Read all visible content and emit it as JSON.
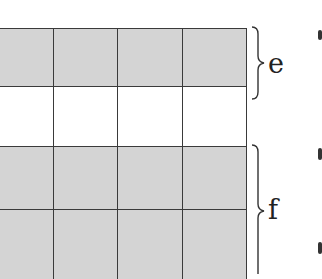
{
  "diagram": {
    "type": "grid-with-brackets",
    "columns_visible": 4,
    "rows": [
      {
        "index": 0,
        "fill": "shaded",
        "cells": 4
      },
      {
        "index": 1,
        "fill": "blank",
        "cells": 4
      },
      {
        "index": 2,
        "fill": "shaded",
        "cells": 4
      },
      {
        "index": 3,
        "fill": "shaded",
        "cells": 4
      }
    ],
    "colors": {
      "shaded": "#d4d4d4",
      "blank": "#ffffff",
      "line": "#3a3a3a"
    },
    "brackets": [
      {
        "label": "e",
        "spans_rows": [
          0
        ],
        "note": "brace extends slightly past row 0"
      },
      {
        "label": "f",
        "spans_rows": [
          2,
          3
        ]
      }
    ]
  }
}
